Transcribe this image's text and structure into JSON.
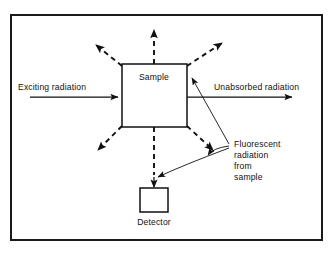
{
  "figure": {
    "kind": "schematic-diagram",
    "width": 334,
    "height": 253,
    "background_color": "#ffffff",
    "line_color": "#111111"
  },
  "frame": {
    "name": "outer-border",
    "x": 11,
    "y": 15,
    "width": 311,
    "height": 225
  },
  "boxes": {
    "sample": {
      "label": "Sample",
      "x": 122,
      "y": 64,
      "width": 65,
      "height": 63,
      "label_x": 154,
      "label_y": 80
    },
    "detector": {
      "label": "Detector",
      "x": 140,
      "y": 188,
      "width": 28,
      "height": 24,
      "label_x": 154,
      "label_y": 225
    }
  },
  "beams": {
    "incoming": {
      "label": "Exciting radiation",
      "label_x": 18,
      "label_y": 90,
      "line_x1": 30,
      "line_x2": 118,
      "line_y": 97,
      "style": "solid",
      "direction": "right"
    },
    "outgoing": {
      "label": "Unabsorbed radiation",
      "label_x": 214,
      "label_y": 90,
      "line_x1": 187,
      "line_x2": 292,
      "line_y": 97,
      "style": "solid",
      "direction": "right"
    }
  },
  "fluorescence": {
    "callout_lines": [
      "Fluorescent",
      "radiation",
      "from",
      "sample"
    ],
    "callout_x": 234,
    "callout_y": 147,
    "callout_line_height": 11,
    "style": "dashed",
    "rays": [
      {
        "name": "ray-up",
        "x1": 154,
        "y1": 64,
        "x2": 154,
        "y2": 30
      },
      {
        "name": "ray-up-left",
        "x1": 122,
        "y1": 66,
        "x2": 96,
        "y2": 45
      },
      {
        "name": "ray-up-right",
        "x1": 187,
        "y1": 66,
        "x2": 222,
        "y2": 43
      },
      {
        "name": "ray-down-left",
        "x1": 122,
        "y1": 126,
        "x2": 98,
        "y2": 150
      },
      {
        "name": "ray-down-right",
        "x1": 187,
        "y1": 126,
        "x2": 213,
        "y2": 150
      },
      {
        "name": "ray-down",
        "x1": 154,
        "y1": 127,
        "x2": 154,
        "y2": 175
      }
    ],
    "leaders": [
      {
        "name": "leader-to-sample-edge",
        "target_x": 192,
        "target_y": 78
      },
      {
        "name": "leader-to-lower-right",
        "target_x": 208,
        "target_y": 155
      },
      {
        "name": "leader-to-detector-path",
        "target_x": 158,
        "target_y": 177
      }
    ]
  },
  "detector_arrow": {
    "name": "arrow-into-detector",
    "x": 154,
    "y1": 177,
    "y2": 187,
    "style": "solid"
  }
}
